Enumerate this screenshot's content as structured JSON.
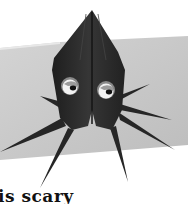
{
  "image": {
    "subject": "origami-octopus",
    "caption": "is scary",
    "colors": {
      "background": "#ffffff",
      "paper_card": "#c8c8c8",
      "origami": "#2a2a2a",
      "eye_white": "#f2f2f2",
      "eye_ring": "#8a8a8a",
      "pupil": "#111111"
    }
  }
}
